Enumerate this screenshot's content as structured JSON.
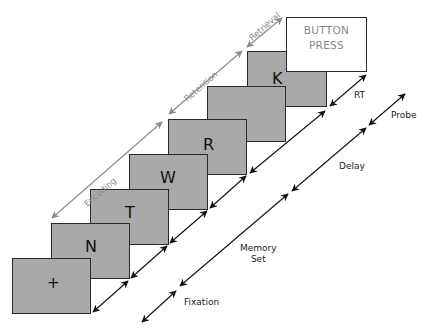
{
  "diagram": {
    "cards": [
      {
        "id": "fixation",
        "letter": "+",
        "left": 12,
        "top": 258
      },
      {
        "id": "n",
        "letter": "N",
        "left": 51,
        "top": 223
      },
      {
        "id": "t",
        "letter": "T",
        "left": 90,
        "top": 189
      },
      {
        "id": "w",
        "letter": "W",
        "left": 129,
        "top": 154
      },
      {
        "id": "r",
        "letter": "R",
        "left": 168,
        "top": 119
      },
      {
        "id": "blank",
        "letter": "",
        "left": 207,
        "top": 86
      },
      {
        "id": "k",
        "letter": "K",
        "left": 247,
        "top": 51
      }
    ],
    "button_box": {
      "line1": "BUTTON",
      "line2": "PRESS"
    },
    "phase_labels": {
      "encoding": "Encoding",
      "retention": "Retention",
      "retrieval": "Retrieval"
    },
    "timeline_labels": {
      "rt": "RT",
      "probe": "Probe",
      "delay": "Delay",
      "memory_set_line1": "Memory",
      "memory_set_line2": "Set",
      "fixation": "Fixation"
    },
    "colors": {
      "card_fill": "#a9a9a9",
      "card_border": "#2a2a2a",
      "phase_arrow": "#8a8a8a",
      "timeline_arrow": "#111111",
      "button_text": "#888888"
    }
  }
}
